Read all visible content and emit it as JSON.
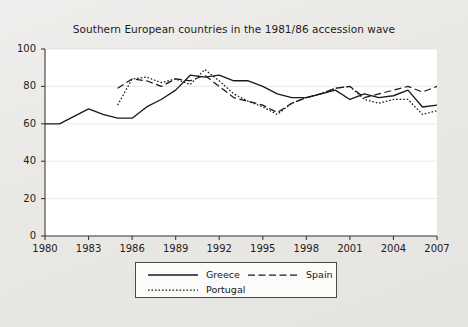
{
  "chart_data": {
    "type": "line",
    "title": "Southern European countries in the 1981/86 accession wave",
    "xlabel": "",
    "ylabel": "",
    "xlim": [
      1980,
      2007
    ],
    "ylim": [
      0,
      100
    ],
    "grid": true,
    "legend_position": "bottom",
    "xticks": [
      "1980",
      "1983",
      "1986",
      "1989",
      "1992",
      "1995",
      "1998",
      "2001",
      "2004",
      "2007"
    ],
    "xtick_values": [
      1980,
      1983,
      1986,
      1989,
      1992,
      1995,
      1998,
      2001,
      2004,
      2007
    ],
    "yticks": [
      "0",
      "20",
      "40",
      "60",
      "80",
      "100"
    ],
    "ytick_values": [
      0,
      20,
      40,
      60,
      80,
      100
    ],
    "x": [
      1980,
      1981,
      1982,
      1983,
      1984,
      1985,
      1986,
      1987,
      1988,
      1989,
      1990,
      1991,
      1992,
      1993,
      1994,
      1995,
      1996,
      1997,
      1998,
      1999,
      2000,
      2001,
      2002,
      2003,
      2004,
      2005,
      2006,
      2007
    ],
    "series": [
      {
        "name": "Greece",
        "style": "solid",
        "color": "#1a1a1a",
        "x": [
          1980,
          1981,
          1982,
          1983,
          1984,
          1985,
          1986,
          1987,
          1988,
          1989,
          1990,
          1991,
          1992,
          1993,
          1994,
          1995,
          1996,
          1997,
          1998,
          1999,
          2000,
          2001,
          2002,
          2003,
          2004,
          2005,
          2006,
          2007
        ],
        "values": [
          60,
          60,
          64,
          68,
          65,
          63,
          63,
          69,
          73,
          78,
          86,
          85,
          86,
          83,
          83,
          80,
          76,
          74,
          74,
          76,
          78,
          73,
          76,
          74,
          75,
          78,
          69,
          70
        ]
      },
      {
        "name": "Spain",
        "style": "dashed",
        "color": "#1a1a1a",
        "x": [
          1985,
          1986,
          1987,
          1988,
          1989,
          1990,
          1991,
          1992,
          1993,
          1994,
          1995,
          1996,
          1997,
          1998,
          1999,
          2000,
          2001,
          2002,
          2003,
          2004,
          2005,
          2006,
          2007
        ],
        "values": [
          79,
          84,
          83,
          80,
          84,
          83,
          86,
          80,
          74,
          72,
          70,
          66,
          71,
          74,
          76,
          79,
          80,
          74,
          76,
          78,
          80,
          77,
          80
        ]
      },
      {
        "name": "Portugal",
        "style": "dotted",
        "color": "#1a1a1a",
        "x": [
          1985,
          1986,
          1987,
          1988,
          1989,
          1990,
          1991,
          1992,
          1993,
          1994,
          1995,
          1996,
          1997,
          1998,
          1999,
          2000,
          2001,
          2002,
          2003,
          2004,
          2005,
          2006,
          2007
        ],
        "values": [
          70,
          84,
          85,
          82,
          84,
          81,
          89,
          83,
          76,
          72,
          69,
          65,
          71,
          74,
          76,
          79,
          80,
          73,
          71,
          73,
          73,
          65,
          67
        ]
      }
    ],
    "annotations": []
  },
  "legend": {
    "entries": [
      {
        "label": "Greece",
        "style": "solid"
      },
      {
        "label": "Spain",
        "style": "dashed"
      },
      {
        "label": "Portugal",
        "style": "dotted"
      }
    ]
  }
}
